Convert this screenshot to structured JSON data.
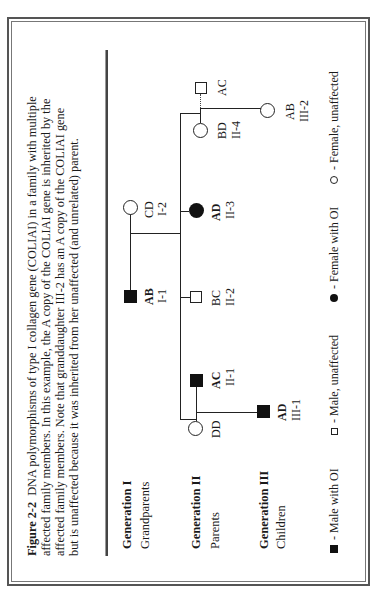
{
  "figure": {
    "orientation": "rotated-90-ccw",
    "caption": {
      "label": "Figure 2-2",
      "lines": [
        "DNA polymorphisms of type I collagen gene (COLIAI) in a family with multiple",
        "affected family members.  In this example, the A copy of the COLIAI gene is inherited by the",
        "affected family members.  Note that granddaughter III-2 has an A copy of the COLIAI gene",
        "but is unaffected because it was inherited from her unaffected (and unrelated) parent."
      ],
      "line1_rest": "DNA polymorphisms of type I collagen gene (COLIAI) in a family with multiple"
    },
    "generations": [
      {
        "title": "Generation I",
        "subtitle": "Grandparents"
      },
      {
        "title": "Generation II",
        "subtitle": "Parents"
      },
      {
        "title": "Generation III",
        "subtitle": "Children"
      }
    ],
    "pedigree": {
      "individuals": [
        {
          "id": "I-1",
          "genotype": "AB",
          "sex": "male",
          "affected": true
        },
        {
          "id": "I-2",
          "genotype": "CD",
          "sex": "female",
          "affected": false
        },
        {
          "id": "II-1",
          "genotype": "AC",
          "sex": "male",
          "affected": true
        },
        {
          "id": "II-1-spouse",
          "genotype": "DD",
          "sex": "female",
          "affected": false
        },
        {
          "id": "II-2",
          "genotype": "BC",
          "sex": "male",
          "affected": false
        },
        {
          "id": "II-3",
          "genotype": "AD",
          "sex": "female",
          "affected": true
        },
        {
          "id": "II-4",
          "genotype": "BD",
          "sex": "female",
          "affected": false
        },
        {
          "id": "II-4-spouse",
          "genotype": "AC",
          "sex": "male",
          "affected": false
        },
        {
          "id": "III-1",
          "genotype": "AD",
          "sex": "male",
          "affected": true
        },
        {
          "id": "III-2",
          "genotype": "AB",
          "sex": "female",
          "affected": false
        }
      ],
      "labels": {
        "I1_geno": "AB",
        "I1_id": "I-1",
        "I2_geno": "CD",
        "I2_id": "I-2",
        "II1_geno": "AC",
        "II1_id": "II-1",
        "II1sp_geno": "DD",
        "II2_geno": "BC",
        "II2_id": "II-2",
        "II3_geno": "AD",
        "II3_id": "II-3",
        "II4_geno": "BD",
        "II4_id": "II-4",
        "II4sp_geno": "AC",
        "III1_geno": "AD",
        "III1_id": "III-1",
        "III2_geno": "AB",
        "III2_id": "III-2"
      }
    },
    "legend": [
      {
        "symbol": "filled-square",
        "label": "- Male with OI"
      },
      {
        "symbol": "open-square",
        "label": "- Male, unaffected"
      },
      {
        "symbol": "filled-circle",
        "label": "- Female with OI"
      },
      {
        "symbol": "open-circle",
        "label": "- Female, unaffected"
      }
    ]
  }
}
